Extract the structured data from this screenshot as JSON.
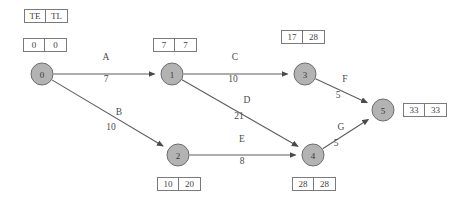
{
  "diagram": {
    "type": "project-network-pert-cpm",
    "legend": {
      "te_label": "TE",
      "tl_label": "TL"
    },
    "nodes": [
      {
        "id": "0",
        "label": "0",
        "cx": 42,
        "cy": 74,
        "r": 11,
        "te": "0",
        "tl": "0",
        "box_x": 23,
        "box_y": 38,
        "box_pos": "above"
      },
      {
        "id": "1",
        "label": "1",
        "cx": 172,
        "cy": 74,
        "r": 11,
        "te": "7",
        "tl": "7",
        "box_x": 153,
        "box_y": 38,
        "box_pos": "above"
      },
      {
        "id": "3",
        "label": "3",
        "cx": 305,
        "cy": 74,
        "r": 11,
        "te": "17",
        "tl": "28",
        "box_x": 281,
        "box_y": 30,
        "box_pos": "above"
      },
      {
        "id": "2",
        "label": "2",
        "cx": 178,
        "cy": 155,
        "r": 11,
        "te": "10",
        "tl": "20",
        "box_x": 157,
        "box_y": 177,
        "box_pos": "below"
      },
      {
        "id": "4",
        "label": "4",
        "cx": 313,
        "cy": 155,
        "r": 11,
        "te": "28",
        "tl": "28",
        "box_x": 292,
        "box_y": 177,
        "box_pos": "below"
      },
      {
        "id": "5",
        "label": "5",
        "cx": 383,
        "cy": 110,
        "r": 11,
        "te": "33",
        "tl": "33",
        "box_x": 403,
        "box_y": 103,
        "box_pos": "right"
      }
    ],
    "edges": [
      {
        "id": "A",
        "from": "0",
        "to": "1",
        "activity": "A",
        "duration": "7",
        "label_x": 106,
        "label_y": 58,
        "dur_x": 106,
        "dur_y": 80
      },
      {
        "id": "B",
        "from": "0",
        "to": "2",
        "activity": "B",
        "duration": "10",
        "label_x": 119,
        "label_y": 113,
        "dur_x": 111,
        "dur_y": 128
      },
      {
        "id": "C",
        "from": "1",
        "to": "3",
        "activity": "C",
        "duration": "10",
        "label_x": 235,
        "label_y": 58,
        "dur_x": 233,
        "dur_y": 80
      },
      {
        "id": "D",
        "from": "1",
        "to": "4",
        "activity": "D",
        "duration": "21",
        "label_x": 247,
        "label_y": 101,
        "dur_x": 239,
        "dur_y": 117
      },
      {
        "id": "E",
        "from": "2",
        "to": "4",
        "activity": "E",
        "duration": "8",
        "label_x": 242,
        "label_y": 140,
        "dur_x": 242,
        "dur_y": 162
      },
      {
        "id": "F",
        "from": "3",
        "to": "5",
        "activity": "F",
        "duration": "5",
        "label_x": 345,
        "label_y": 80,
        "dur_x": 338,
        "dur_y": 96
      },
      {
        "id": "G",
        "from": "4",
        "to": "5",
        "activity": "G",
        "duration": "5",
        "label_x": 341,
        "label_y": 128,
        "dur_x": 336,
        "dur_y": 144
      }
    ],
    "colors": {
      "node_fill": "#b3b3b3",
      "node_stroke": "#6e6e6e",
      "edge_stroke": "#5d5d5d",
      "box_stroke": "#7a7a7a",
      "text": "#3f3f3f",
      "background": "#ffffff"
    }
  }
}
